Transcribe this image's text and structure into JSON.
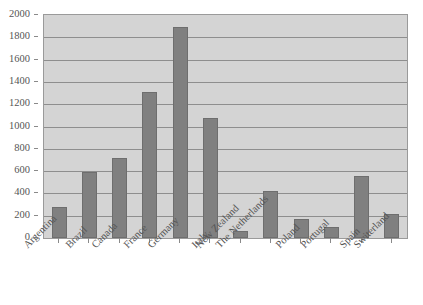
{
  "chart_data": {
    "type": "bar",
    "title": "",
    "subtitle": "",
    "xlabel": "",
    "ylabel": "",
    "ylim": [
      0,
      2000
    ],
    "ytick_step": 200,
    "yticks": [
      "0",
      "200",
      "400",
      "600",
      "800",
      "1000",
      "1200",
      "1400",
      "1600",
      "1800",
      "2000"
    ],
    "grid": true,
    "grid_orientation": "horizontal",
    "legend": false,
    "legend_position": "none",
    "xtick_rotation": -45,
    "categories": [
      "Argentina",
      "Brazil",
      "Canada",
      "France",
      "Germany",
      "Italy",
      "New Zealand",
      "The Netherlands",
      "Poland",
      "Portugal",
      "Spain",
      "Switerland"
    ],
    "values": [
      280,
      590,
      720,
      1310,
      1890,
      1080,
      60,
      420,
      170,
      100,
      555,
      215
    ]
  },
  "style": {
    "bar_color": "#808080",
    "bar_border_color": "#6e6e6e",
    "plot_background": "#d4d4d4",
    "plot_border_color": "#9a9a9a",
    "gridline_color": "#8e8e8e",
    "text_color": "#555555",
    "page_background": "#ffffff"
  }
}
